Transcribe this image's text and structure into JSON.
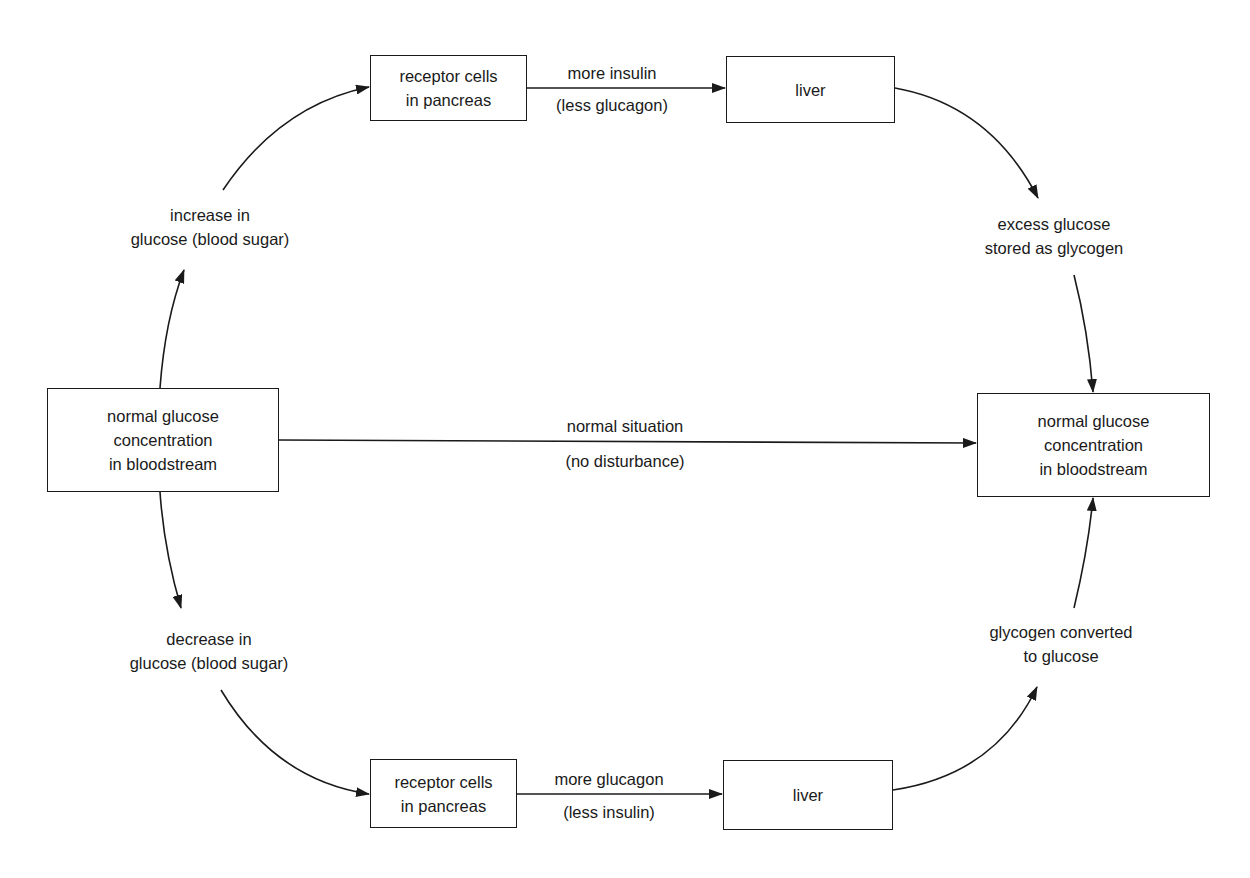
{
  "diagram": {
    "boxes": {
      "start": [
        "normal glucose",
        "concentration",
        "in bloodstream"
      ],
      "end": [
        "normal glucose",
        "concentration",
        "in bloodstream"
      ],
      "top_receptor": [
        "receptor cells",
        "in pancreas"
      ],
      "top_liver": [
        "liver"
      ],
      "bottom_receptor": [
        "receptor cells",
        "in pancreas"
      ],
      "bottom_liver": [
        "liver"
      ]
    },
    "labels": {
      "increase": [
        "increase in",
        "glucose (blood sugar)"
      ],
      "decrease": [
        "decrease in",
        "glucose (blood sugar)"
      ],
      "excess": [
        "excess glucose",
        "stored as glycogen"
      ],
      "converted": [
        "glycogen converted",
        "to glucose"
      ],
      "top_edge_above": "more insulin",
      "top_edge_below": "(less glucagon)",
      "bottom_edge_above": "more glucagon",
      "bottom_edge_below": "(less insulin)",
      "middle_above": "normal situation",
      "middle_below": "(no disturbance)"
    },
    "line_color": "#1a1a1a"
  }
}
